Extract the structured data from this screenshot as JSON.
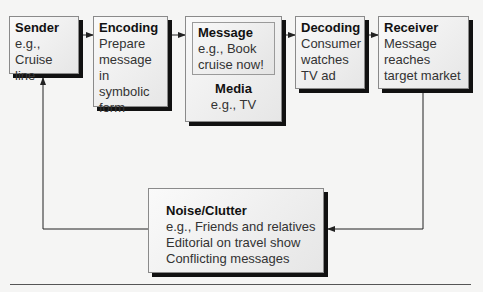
{
  "diagram": {
    "type": "communication-process-flow",
    "nodes": {
      "sender": {
        "title": "Sender",
        "body": "e.g., Cruise\nline"
      },
      "encoding": {
        "title": "Encoding",
        "body": "Prepare\nmessage in\nsymbolic\nform"
      },
      "message": {
        "title": "Message",
        "body": "e.g., Book\ncruise now!"
      },
      "media": {
        "title": "Media",
        "body": "e.g., TV"
      },
      "decoding": {
        "title": "Decoding",
        "body": "Consumer\nwatches\nTV ad"
      },
      "receiver": {
        "title": "Receiver",
        "body": "Message\nreaches\ntarget market"
      },
      "noise": {
        "title": "Noise/Clutter",
        "body": "e.g., Friends and relatives\nEditorial on travel show\nConflicting messages"
      }
    },
    "edges": [
      {
        "from": "sender",
        "to": "encoding"
      },
      {
        "from": "encoding",
        "to": "message-media"
      },
      {
        "from": "message-media",
        "to": "decoding"
      },
      {
        "from": "decoding",
        "to": "receiver"
      },
      {
        "from": "receiver",
        "to": "noise",
        "label": ""
      },
      {
        "from": "noise",
        "to": "sender",
        "label": ""
      }
    ],
    "colors": {
      "background": "#f5f5f4",
      "box_border": "#8a8a8a",
      "shadow": "#111111",
      "line": "#333333"
    }
  }
}
